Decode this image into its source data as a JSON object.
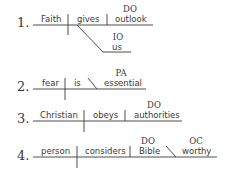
{
  "diagrams": [
    {
      "number": "1.",
      "subject": "Faith",
      "verb": "gives",
      "direct_object": {
        "label": "DO",
        "word": "outlook"
      },
      "indirect_object": {
        "label": "IO",
        "word": "us"
      }
    },
    {
      "number": "2.",
      "subject": "fear",
      "verb": "is",
      "predicate_adjective": {
        "label": "PA",
        "word": "essential"
      }
    },
    {
      "number": "3.",
      "subject": "Christian",
      "verb": "obeys",
      "direct_object": {
        "label": "DO",
        "word": "authorities"
      }
    },
    {
      "number": "4.",
      "subject": "person",
      "verb": "considers",
      "direct_object": {
        "label": "DO",
        "word": "Bible"
      },
      "object_complement": {
        "label": "OC",
        "word": "worthy"
      }
    }
  ]
}
